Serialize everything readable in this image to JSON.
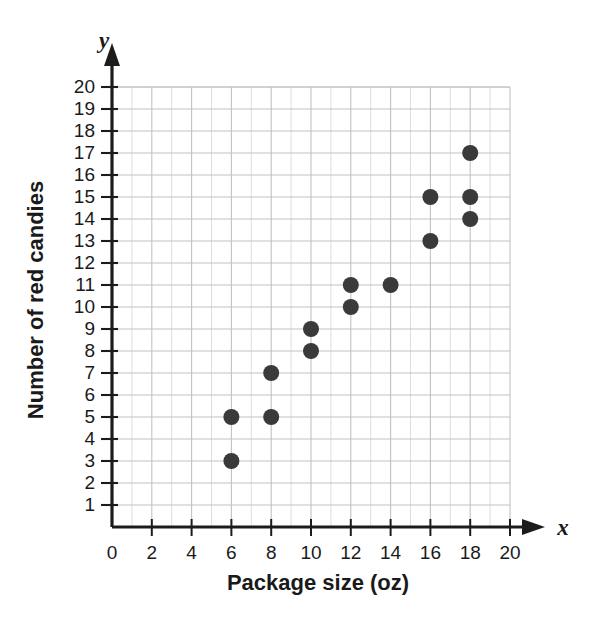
{
  "chart_data": {
    "type": "scatter",
    "title": "",
    "xlabel": "Package size (oz)",
    "ylabel": "Number of red candies",
    "x_axis_variable": "x",
    "y_axis_variable": "y",
    "xlim": [
      0,
      20
    ],
    "ylim": [
      0,
      20
    ],
    "x_ticks": [
      0,
      2,
      4,
      6,
      8,
      10,
      12,
      14,
      16,
      18,
      20
    ],
    "y_ticks": [
      1,
      2,
      3,
      4,
      5,
      6,
      7,
      8,
      9,
      10,
      11,
      12,
      13,
      14,
      15,
      16,
      17,
      18,
      19,
      20
    ],
    "x_tick_labels": [
      "0",
      "2",
      "4",
      "6",
      "8",
      "10",
      "12",
      "14",
      "16",
      "18",
      "20"
    ],
    "y_tick_labels": [
      "1",
      "2",
      "3",
      "4",
      "5",
      "6",
      "7",
      "8",
      "9",
      "10",
      "11",
      "12",
      "13",
      "14",
      "15",
      "16",
      "17",
      "18",
      "19",
      "20"
    ],
    "grid": true,
    "grid_minor_step_x": 1,
    "grid_major_step_x": 2,
    "grid_step_y": 1,
    "legend": null,
    "points": [
      {
        "x": 6,
        "y": 3
      },
      {
        "x": 6,
        "y": 5
      },
      {
        "x": 8,
        "y": 5
      },
      {
        "x": 8,
        "y": 7
      },
      {
        "x": 10,
        "y": 8
      },
      {
        "x": 10,
        "y": 9
      },
      {
        "x": 12,
        "y": 10
      },
      {
        "x": 12,
        "y": 11
      },
      {
        "x": 14,
        "y": 11
      },
      {
        "x": 16,
        "y": 13
      },
      {
        "x": 16,
        "y": 15
      },
      {
        "x": 18,
        "y": 14
      },
      {
        "x": 18,
        "y": 15
      },
      {
        "x": 18,
        "y": 17
      }
    ],
    "point_color": "#3a3a3a",
    "point_radius": 8,
    "axis_color": "#1c1c1c",
    "grid_color": "#d9d9d9",
    "background_color": "#ffffff"
  },
  "axes": {
    "x_variable_label": "x",
    "y_variable_label": "y",
    "x_title": "Package size (oz)",
    "y_title": "Number of red candies"
  }
}
